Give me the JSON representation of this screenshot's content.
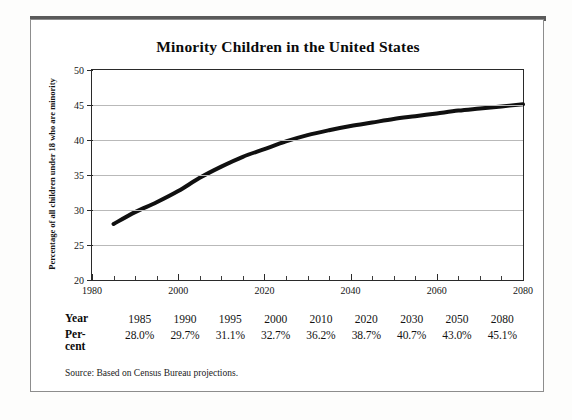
{
  "figure": {
    "title": "Minority Children in the United States",
    "source_note": "Source: Based on Census Bureau projections."
  },
  "table": {
    "year_row_label": "Year",
    "percent_row_label_line1": "Per-",
    "percent_row_label_line2": "cent",
    "years": [
      "1985",
      "1990",
      "1995",
      "2000",
      "2010",
      "2020",
      "2030",
      "2050",
      "2080"
    ],
    "percents": [
      "28.0%",
      "29.7%",
      "31.1%",
      "32.7%",
      "36.2%",
      "38.7%",
      "40.7%",
      "43.0%",
      "45.1%"
    ]
  },
  "colors": {
    "curve": "#101010",
    "gridline": "#b9b9b9",
    "axis": "#2a2a2a",
    "topbar": "#5a5a5a",
    "card_border": "#8d8d8d",
    "page_background": "#fdfdfc"
  },
  "chart_data": {
    "type": "line",
    "title": "Minority Children in the United States",
    "xlabel": "",
    "ylabel": "Percentage of all children under 18 who are minority",
    "xlim": [
      1980,
      2080
    ],
    "ylim": [
      20,
      50
    ],
    "xticks": [
      1980,
      2000,
      2020,
      2040,
      2060,
      2080
    ],
    "xticklabels": [
      "1980",
      "2000",
      "2020",
      "2040",
      "2060",
      "2080"
    ],
    "xminor_tick_step": 5,
    "yticks": [
      20,
      25,
      30,
      35,
      40,
      45,
      50
    ],
    "yticklabels": [
      "20",
      "25",
      "30",
      "35",
      "40",
      "45",
      "50"
    ],
    "grid": true,
    "grid_axis": "y",
    "legend": false,
    "line_width_px": 4,
    "series": [
      {
        "name": "Percentage of all children under 18 who are minority",
        "x": [
          1985,
          1990,
          1995,
          2000,
          2005,
          2010,
          2015,
          2020,
          2025,
          2030,
          2035,
          2040,
          2045,
          2050,
          2055,
          2060,
          2065,
          2070,
          2075,
          2080
        ],
        "values": [
          28.0,
          29.7,
          31.1,
          32.7,
          34.6,
          36.2,
          37.6,
          38.7,
          39.8,
          40.7,
          41.4,
          42.0,
          42.5,
          43.0,
          43.4,
          43.8,
          44.2,
          44.5,
          44.8,
          45.1
        ]
      }
    ],
    "labeled_points": {
      "years": [
        1985,
        1990,
        1995,
        2000,
        2010,
        2020,
        2030,
        2050,
        2080
      ],
      "values": [
        28.0,
        29.7,
        31.1,
        32.7,
        36.2,
        38.7,
        40.7,
        43.0,
        45.1
      ]
    }
  }
}
